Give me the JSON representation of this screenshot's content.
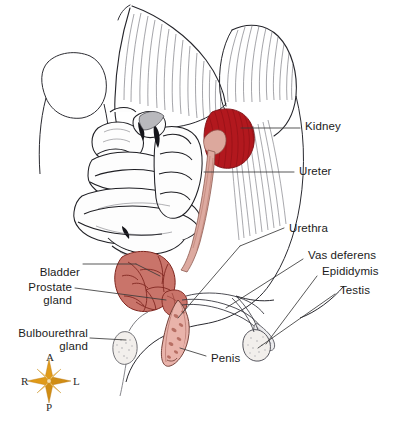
{
  "figure": {
    "background_color": "#ffffff",
    "width": 401,
    "height": 430
  },
  "colors": {
    "ink": "#1b1b1b",
    "hatch": "#4a4a52",
    "leader_line": "#3a3a3a",
    "kidney": "#b2191f",
    "kidney_shade": "#8d1016",
    "bladder": "#c9746a",
    "bladder_vessel": "#7d241d",
    "ureter": "#ddaaa0",
    "penis": "#e9b3ab",
    "penis_detail": "#9e5247",
    "gland_pale": "#f2efec",
    "compass_gold": "#e09a18",
    "compass_gold_dark": "#b8730c",
    "compass_pale": "#f7dfae",
    "organ_white": "#fdfdfd"
  },
  "labels": {
    "right_side": [
      {
        "id": "kidney",
        "text": "Kidney",
        "x": 305,
        "y": 120
      },
      {
        "id": "ureter",
        "text": "Ureter",
        "x": 299,
        "y": 165
      },
      {
        "id": "urethra",
        "text": "Urethra",
        "x": 289,
        "y": 222
      },
      {
        "id": "vas-deferens",
        "text": "Vas deferens",
        "x": 308,
        "y": 255
      },
      {
        "id": "epididymis",
        "text": "Epididymis",
        "x": 322,
        "y": 271
      },
      {
        "id": "testis",
        "text": "Testis",
        "x": 340,
        "y": 290
      }
    ],
    "left_side": [
      {
        "id": "bladder",
        "text": "Bladder",
        "x": 44,
        "y": 266,
        "align": "right"
      },
      {
        "id": "prostate-gland",
        "text": "Prostate\ngland",
        "x": 22,
        "y": 280,
        "align": "right"
      },
      {
        "id": "bulbourethral",
        "text": "Bulbourethral\ngland",
        "x": 24,
        "y": 327,
        "align": "right"
      }
    ],
    "bottom": [
      {
        "id": "penis",
        "text": "Penis",
        "x": 211,
        "y": 358
      }
    ]
  },
  "compass": {
    "name": "orientation-compass",
    "center_x": 49,
    "center_y": 381,
    "points": [
      {
        "id": "anterior",
        "letter": "A",
        "x": 46,
        "y": 352
      },
      {
        "id": "left",
        "letter": "L",
        "x": 73,
        "y": 376
      },
      {
        "id": "posterior",
        "letter": "P",
        "x": 46,
        "y": 402
      },
      {
        "id": "right",
        "letter": "R",
        "x": 21,
        "y": 376
      }
    ]
  },
  "structures": [
    {
      "id": "kidney",
      "name": "kidney",
      "fill": "#b2191f"
    },
    {
      "id": "ureter",
      "name": "ureter",
      "fill": "#ddaaa0"
    },
    {
      "id": "urinary-bladder",
      "name": "urinary-bladder",
      "fill": "#c9746a"
    },
    {
      "id": "prostate-gland",
      "name": "prostate-gland",
      "fill": "#c9746a"
    },
    {
      "id": "urethra",
      "name": "urethra",
      "fill": "#ddaaa0"
    },
    {
      "id": "vas-deferens",
      "name": "vas-deferens",
      "fill": "#ffffff"
    },
    {
      "id": "epididymis",
      "name": "epididymis",
      "fill": "#f2efec"
    },
    {
      "id": "testis",
      "name": "testis",
      "fill": "#f2efec"
    },
    {
      "id": "bulbourethral-gland",
      "name": "bulbourethral-gland",
      "fill": "#f2efec"
    },
    {
      "id": "penis",
      "name": "penis",
      "fill": "#e9b3ab"
    },
    {
      "id": "small-intestine",
      "name": "small-intestine-coils",
      "fill": "#fdfdfd"
    },
    {
      "id": "abdominal-musculature",
      "name": "abdominal-musculature",
      "fill": "#ffffff"
    }
  ]
}
